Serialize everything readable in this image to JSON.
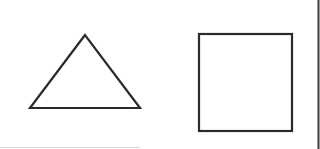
{
  "figure": {
    "background": "#ffffff",
    "stroke_color": "#2b2b2b",
    "shapes": [
      {
        "id": "triangle",
        "type": "triangle",
        "points": "85,35 30,108 140,108",
        "stroke_width": 2.2
      },
      {
        "id": "square",
        "type": "rectangle",
        "x": 199,
        "y": 34,
        "width": 93,
        "height": 97,
        "stroke_width": 2.2
      }
    ],
    "right_border": {
      "x": 318.5,
      "color": "#3a3a3a",
      "width": 2
    },
    "bottom_line": {
      "y": 147.5,
      "x1": 0,
      "x2": 140,
      "color": "#d8d8d8"
    }
  }
}
